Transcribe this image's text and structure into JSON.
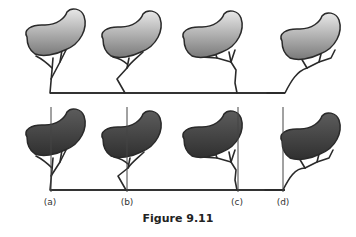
{
  "figure": {
    "caption": "Figure 9.11",
    "colors": {
      "light_top": "#e6e6e6",
      "light_bottom": "#7a7a7a",
      "dark_top": "#5a5a5a",
      "dark_bottom": "#2e2e2e",
      "stroke": "#2a2a2a",
      "ground": "#333333",
      "reference_line": "#444444"
    },
    "rows": [
      {
        "name": "top-row",
        "style": "light",
        "has_reference_lines": false,
        "ground_y": 93,
        "ground_x": [
          50,
          285
        ],
        "trees": [
          {
            "base_x": 50,
            "crown_x": 25,
            "crown_y": 10,
            "trunk": "straight-forked"
          },
          {
            "base_x": 125,
            "crown_x": 101,
            "crown_y": 12,
            "trunk": "bent-knee"
          },
          {
            "base_x": 237,
            "crown_x": 182,
            "crown_y": 12,
            "trunk": "kinked"
          },
          {
            "base_x": 285,
            "crown_x": 280,
            "crown_y": 14,
            "trunk": "leaning"
          }
        ]
      },
      {
        "name": "bottom-row",
        "style": "dark",
        "has_reference_lines": true,
        "ground_y": 190,
        "ground_x": [
          50,
          285
        ],
        "trees": [
          {
            "base_x": 50,
            "crown_x": 25,
            "crown_y": 110,
            "trunk": "straight-forked",
            "ref_x": 51,
            "label": "(a)"
          },
          {
            "base_x": 126,
            "crown_x": 101,
            "crown_y": 112,
            "trunk": "bent-knee",
            "ref_x": 127,
            "label": "(b)"
          },
          {
            "base_x": 237,
            "crown_x": 182,
            "crown_y": 112,
            "trunk": "kinked",
            "ref_x": 238,
            "label": "(c)"
          },
          {
            "base_x": 283,
            "crown_x": 280,
            "crown_y": 114,
            "trunk": "leaning",
            "ref_x": 283,
            "label": "(d)"
          }
        ]
      }
    ],
    "labels": [
      "(a)",
      "(b)",
      "(c)",
      "(d)"
    ]
  }
}
